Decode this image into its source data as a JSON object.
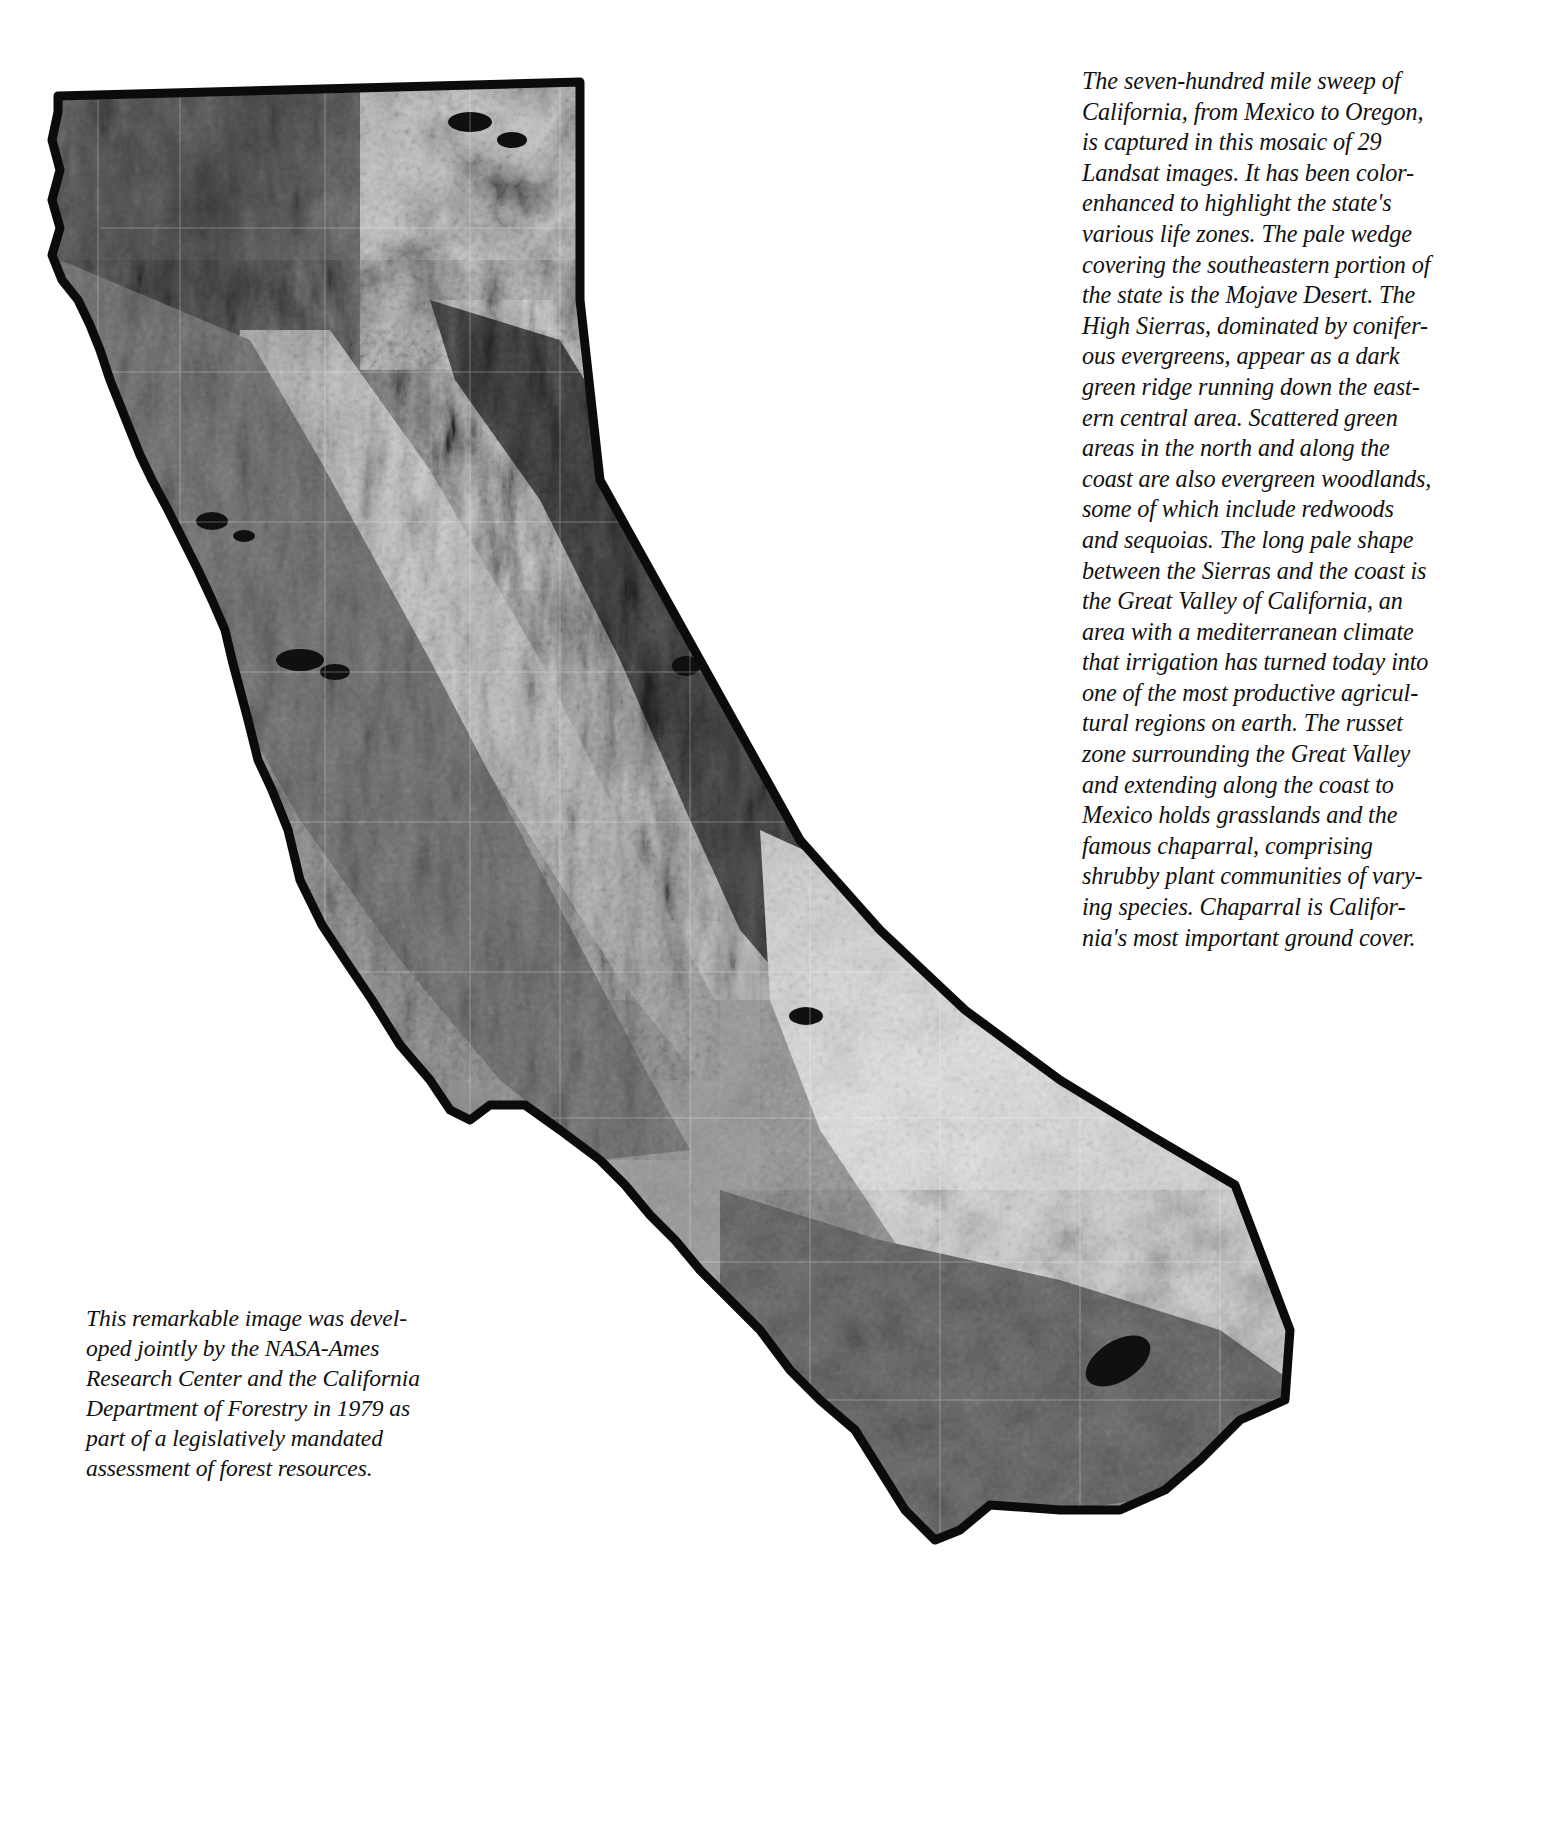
{
  "page": {
    "background_color": "#ffffff",
    "width": 1554,
    "height": 1824
  },
  "figure": {
    "name": "california-landsat-mosaic",
    "imagery": "Landsat satellite mosaic, grayscale",
    "ocean_color": "#ffffff",
    "coastline_color": "#0b0b0b",
    "land_tones": [
      "#2a2a2a",
      "#4a4a4a",
      "#6d6d6d",
      "#8d8d8d",
      "#adadad",
      "#c9c9c9",
      "#e2e2e2"
    ]
  },
  "caption_right": {
    "name": "right-caption",
    "text": "The seven-hundred mile sweep of California, from Mexico to Oregon, is captured in this mosaic of 29 Landsat images. It has been color-enhanced to highlight the state's various life zones. The pale wedge covering the southeastern portion of the state is the Mojave Desert. The High Sierras, dominated by coniferous evergreens, appear as a dark green ridge running down the eastern central area. Scattered green areas in the north and along the coast are also evergreen woodlands, some of which include redwoods and sequoias. The long pale shape between the Sierras and the coast is the Great Valley of California, an area with a mediterranean climate that irrigation has turned today into one of the most productive agricultural regions on earth. The russet zone surrounding the Great Valley and extending along the coast to Mexico holds grasslands and the famous chaparral, comprising shrubby plant communities of varying species. Chaparral is California's most important ground cover.",
    "lines": [
      "The seven-hundred mile sweep of",
      "California, from Mexico to Oregon,",
      "is captured in this mosaic of 29",
      "Landsat images. It has been color-",
      "enhanced to highlight the state's",
      "various life zones. The pale wedge",
      "covering the southeastern portion of",
      "the state is the Mojave Desert. The",
      "High Sierras, dominated by conifer-",
      "ous evergreens, appear as a dark",
      "green ridge running down the east-",
      "ern central area. Scattered green",
      "areas in the north and along the",
      "coast are also evergreen woodlands,",
      "some of which include redwoods",
      "and sequoias. The long pale shape",
      "between the Sierras and the coast is",
      "the Great Valley of California, an",
      "area with a mediterranean climate",
      "that irrigation has turned today into",
      "one of the most productive agricul-",
      "tural regions on earth. The russet",
      "zone surrounding the Great Valley",
      "and extending along the coast to",
      "Mexico holds grasslands and the",
      "famous chaparral, comprising",
      "shrubby plant communities of vary-",
      "ing species. Chaparral is Califor-",
      "nia's most important ground cover."
    ]
  },
  "caption_bottom_left": {
    "name": "bottom-left-caption",
    "text": "This remarkable image was developed jointly by the NASA-Ames Research Center and the California Department of Forestry in 1979 as part of a legislatively mandated assessment of forest resources.",
    "lines": [
      "This remarkable image was devel-",
      "oped jointly by the NASA-Ames",
      "Research Center and the California",
      "Department of Forestry in 1979 as",
      "part of a legislatively mandated",
      "assessment of forest resources."
    ]
  }
}
